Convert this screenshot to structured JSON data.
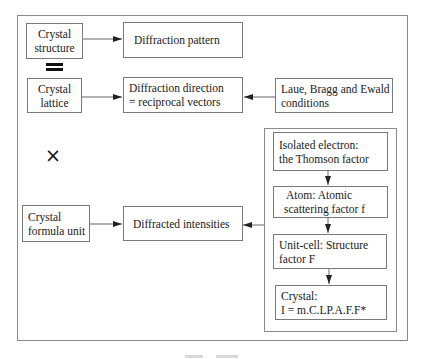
{
  "diagram": {
    "boxes": {
      "crystal_structure": [
        "Crystal",
        "structure"
      ],
      "diffraction_pattern": [
        "Diffraction pattern"
      ],
      "crystal_lattice": [
        "Crystal",
        "lattice"
      ],
      "diffraction_direction": [
        "Diffraction direction",
        "= reciprocal vectors"
      ],
      "laue_bragg_ewald": [
        "Laue, Bragg and Ewald",
        "conditions"
      ],
      "crystal_formula_unit": [
        "Crystal",
        "formula unit"
      ],
      "diffracted_intensities": [
        "Diffracted intensities"
      ],
      "isolated_electron": [
        "Isolated electron:",
        "the Thomson factor"
      ],
      "atom": [
        "Atom: Atomic",
        "scattering factor f"
      ],
      "unit_cell": [
        "Unit-cell: Structure",
        "factor F"
      ],
      "crystal_intensity": [
        "Crystal:",
        "I = m.C.LP.A.F.F*"
      ]
    },
    "symbols": {
      "equals": "=",
      "times": "×"
    },
    "edges": [
      {
        "from": "crystal_structure",
        "to": "diffraction_pattern"
      },
      {
        "from": "crystal_lattice",
        "to": "diffraction_direction"
      },
      {
        "from": "laue_bragg_ewald",
        "to": "diffraction_direction"
      },
      {
        "from": "crystal_formula_unit",
        "to": "diffracted_intensities"
      },
      {
        "from": "intensity_group",
        "to": "diffracted_intensities"
      },
      {
        "from": "isolated_electron",
        "to": "atom"
      },
      {
        "from": "atom",
        "to": "unit_cell"
      },
      {
        "from": "unit_cell",
        "to": "crystal_intensity"
      }
    ],
    "colors": {
      "border": "#7a7a7a",
      "arrow": "#222222"
    }
  }
}
